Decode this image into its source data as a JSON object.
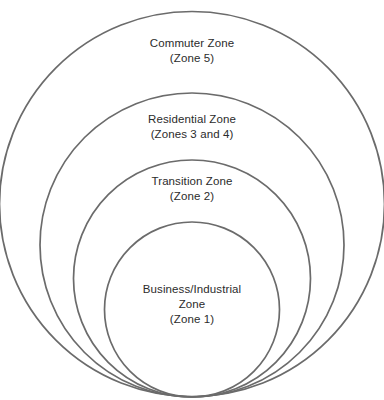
{
  "diagram": {
    "type": "concentric-circles",
    "stroke_color": "#6b6b6b",
    "text_color": "#2b2b2b",
    "background_color": "#ffffff",
    "zones": [
      {
        "id": "zone5",
        "name": "Commuter Zone",
        "line1": "Commuter Zone",
        "line2": "(Zone 5)",
        "line3": "",
        "zone_numbers": "5",
        "ring_order": 4,
        "center_x": 192,
        "center_y": 204,
        "radius": 192.5
      },
      {
        "id": "zone34",
        "name": "Residential Zone",
        "line1": "Residential Zone",
        "line2": "(Zones 3 and 4)",
        "line3": "",
        "zone_numbers": "3 and 4",
        "ring_order": 3,
        "center_x": 192,
        "center_y": 245,
        "radius": 152
      },
      {
        "id": "zone2",
        "name": "Transition Zone",
        "line1": "Transition Zone",
        "line2": "(Zone 2)",
        "line3": "",
        "zone_numbers": "2",
        "ring_order": 2,
        "center_x": 192,
        "center_y": 278.5,
        "radius": 118.5
      },
      {
        "id": "zone1",
        "name": "Business/Industrial Zone",
        "line1": "Business/Industrial",
        "line2": "Zone",
        "line3": "(Zone 1)",
        "zone_numbers": "1",
        "ring_order": 1,
        "center_x": 192,
        "center_y": 309.5,
        "radius": 87.5
      }
    ]
  }
}
